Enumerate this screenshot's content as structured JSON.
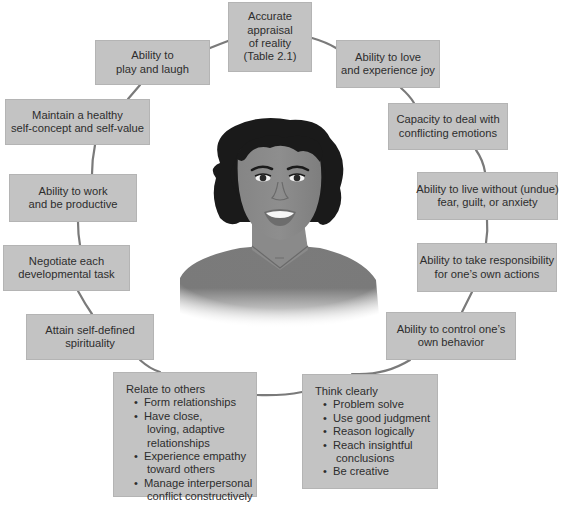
{
  "diagram": {
    "type": "mental-health-characteristics-ring",
    "center": {
      "illustration": "smiling-woman-portrait"
    },
    "colors": {
      "box_fill": "#c3c3c3",
      "ring_line": "#7a7a7a",
      "text": "#2d2d2d",
      "skin": "#8a8a8a",
      "hair": "#1a1a1a",
      "shirt": "#7d7d7d"
    },
    "nodes": [
      {
        "id": "accurate-appraisal",
        "lines": [
          "Accurate",
          "appraisal",
          "of reality",
          "(Table 2.1)"
        ]
      },
      {
        "id": "love-joy",
        "lines": [
          "Ability to love",
          "and experience joy"
        ]
      },
      {
        "id": "conflicting-emotions",
        "lines": [
          "Capacity to deal with",
          "conflicting emotions"
        ]
      },
      {
        "id": "live-without-fear",
        "lines": [
          "Ability to live without (undue)",
          "fear, guilt, or anxiety"
        ]
      },
      {
        "id": "take-responsibility",
        "lines": [
          "Ability to take responsibility",
          "for one’s own actions"
        ]
      },
      {
        "id": "control-behavior",
        "lines": [
          "Ability to control one’s",
          "own behavior"
        ]
      },
      {
        "id": "think-clearly",
        "title": "Think clearly",
        "bullets": [
          [
            "Problem solve"
          ],
          [
            "Use good judgment"
          ],
          [
            "Reason logically"
          ],
          [
            "Reach insightful",
            "conclusions"
          ],
          [
            "Be creative"
          ]
        ]
      },
      {
        "id": "relate-to-others",
        "title": "Relate to others",
        "bullets": [
          [
            "Form relationships"
          ],
          [
            "Have close,",
            "loving, adaptive",
            "relationships"
          ],
          [
            "Experience empathy",
            "toward others"
          ],
          [
            "Manage interpersonal",
            "conflict constructively"
          ]
        ]
      },
      {
        "id": "spirituality",
        "lines": [
          "Attain self-defined",
          "spirituality"
        ]
      },
      {
        "id": "developmental-task",
        "lines": [
          "Negotiate each",
          "developmental task"
        ]
      },
      {
        "id": "work-productive",
        "lines": [
          "Ability to work",
          "and be productive"
        ]
      },
      {
        "id": "self-concept",
        "lines": [
          "Maintain a healthy",
          "self-concept and self-value"
        ]
      },
      {
        "id": "play-laugh",
        "lines": [
          "Ability to",
          "play and laugh"
        ]
      }
    ]
  }
}
